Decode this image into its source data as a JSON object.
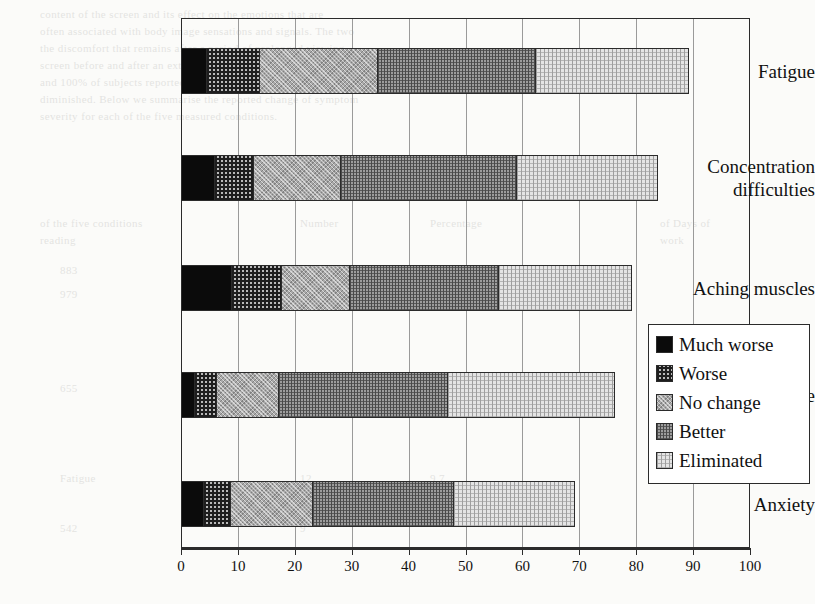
{
  "chart_data": {
    "type": "bar",
    "orientation": "horizontal",
    "stacked": true,
    "title": "",
    "xlabel": "",
    "ylabel": "",
    "xlim": [
      0,
      100
    ],
    "xticks": [
      0,
      10,
      20,
      30,
      40,
      50,
      60,
      70,
      80,
      90,
      100
    ],
    "grid": true,
    "grid_axis": "x",
    "legend_position": "center-right",
    "categories": [
      "Fatigue",
      "Concentration difficulties",
      "Aching muscles",
      "Headache",
      "Anxiety"
    ],
    "series": [
      {
        "name": "Much worse",
        "values": [
          4.5,
          6,
          9,
          2.5,
          4
        ]
      },
      {
        "name": "Worse",
        "values": [
          9.5,
          7,
          9,
          4,
          5
        ]
      },
      {
        "name": "No change",
        "values": [
          21,
          15.5,
          12,
          11,
          14.5
        ]
      },
      {
        "name": "Better",
        "values": [
          28,
          31,
          26.5,
          30,
          25
        ]
      },
      {
        "name": "Eliminated",
        "values": [
          27,
          25,
          23.5,
          29.5,
          21.5
        ]
      }
    ],
    "totals": [
      90,
      84.5,
      79.5,
      77,
      70
    ],
    "cumulative": [
      [
        4.5,
        14,
        35,
        63,
        90
      ],
      [
        6,
        13,
        28.5,
        59.5,
        84.5
      ],
      [
        9,
        18,
        30,
        56.5,
        79.5
      ],
      [
        2.5,
        6.5,
        17.5,
        47.5,
        77
      ],
      [
        4,
        9,
        23.5,
        48.5,
        70
      ]
    ]
  },
  "legend": {
    "items": [
      {
        "label": "Much worse",
        "swatch": "much-worse"
      },
      {
        "label": "Worse",
        "swatch": "worse"
      },
      {
        "label": "No change",
        "swatch": "no-change"
      },
      {
        "label": "Better",
        "swatch": "better"
      },
      {
        "label": "Eliminated",
        "swatch": "eliminated"
      }
    ]
  },
  "axis": {
    "tick_labels": [
      "0",
      "10",
      "20",
      "30",
      "40",
      "50",
      "60",
      "70",
      "80",
      "90",
      "100"
    ]
  },
  "category_labels": [
    {
      "lines": [
        "Fatigue"
      ]
    },
    {
      "lines": [
        "Concentration",
        "difficulties"
      ]
    },
    {
      "lines": [
        "Aching muscles"
      ]
    },
    {
      "lines": [
        "Headache"
      ]
    },
    {
      "lines": [
        "Anxiety"
      ]
    }
  ],
  "background_text": [
    {
      "x": 40,
      "y": 6,
      "text": "content of the screen and its effect on the emotions that are"
    },
    {
      "x": 40,
      "y": 23,
      "text": "often associated with body image sensations and signals. The two"
    },
    {
      "x": 40,
      "y": 40,
      "text": "the discomfort that remains after a period of prolonged viewing"
    },
    {
      "x": 40,
      "y": 57,
      "text": "screen before and after an extended session with a standard display"
    },
    {
      "x": 40,
      "y": 74,
      "text": "and 100% of subjects reported improvement over a baseline"
    },
    {
      "x": 40,
      "y": 91,
      "text": "diminished. Below we summarise the reported change of symptom"
    },
    {
      "x": 40,
      "y": 108,
      "text": "severity for each of the five measured conditions."
    },
    {
      "x": 40,
      "y": 215,
      "text": "of the five conditions"
    },
    {
      "x": 300,
      "y": 215,
      "text": "Number"
    },
    {
      "x": 430,
      "y": 215,
      "text": "Percentage"
    },
    {
      "x": 660,
      "y": 215,
      "text": "of Days of"
    },
    {
      "x": 40,
      "y": 232,
      "text": "reading"
    },
    {
      "x": 660,
      "y": 232,
      "text": "work"
    },
    {
      "x": 60,
      "y": 262,
      "text": "883"
    },
    {
      "x": 60,
      "y": 286,
      "text": "979"
    },
    {
      "x": 300,
      "y": 262,
      "text": "41"
    },
    {
      "x": 300,
      "y": 286,
      "text": "36"
    },
    {
      "x": 430,
      "y": 262,
      "text": "26.4"
    },
    {
      "x": 430,
      "y": 286,
      "text": "21.9"
    },
    {
      "x": 60,
      "y": 380,
      "text": "655"
    },
    {
      "x": 300,
      "y": 380,
      "text": "18"
    },
    {
      "x": 430,
      "y": 380,
      "text": "15.2"
    },
    {
      "x": 60,
      "y": 470,
      "text": "Fatigue"
    },
    {
      "x": 300,
      "y": 470,
      "text": "12"
    },
    {
      "x": 430,
      "y": 470,
      "text": "9.7"
    },
    {
      "x": 60,
      "y": 520,
      "text": "542"
    },
    {
      "x": 300,
      "y": 520,
      "text": "9"
    }
  ]
}
